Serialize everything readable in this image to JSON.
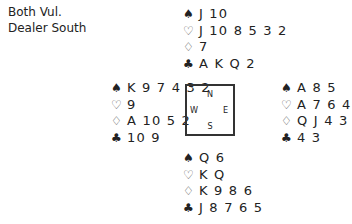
{
  "info": {
    "vulnerability": "Both Vul.",
    "dealer": "Dealer South"
  },
  "suits": {
    "spades": "♠",
    "hearts": "♡",
    "diamonds": "♢",
    "clubs": "♣"
  },
  "compass": {
    "north": "N",
    "south": "S",
    "west": "W",
    "east": "E"
  },
  "hands": {
    "north": {
      "spades": "J 10",
      "hearts": "J 10 8 5 3 2",
      "diamonds": "7",
      "clubs": "A K Q 2"
    },
    "west": {
      "spades": "K 9 7 4 3 2",
      "hearts": "9",
      "diamonds": "A 10 5 2",
      "clubs": "10 9"
    },
    "east": {
      "spades": "A 8 5",
      "hearts": "A 7 6 4",
      "diamonds": "Q J 4 3",
      "clubs": "4 3"
    },
    "south": {
      "spades": "Q 6",
      "hearts": "K Q",
      "diamonds": "K 9 8 6",
      "clubs": "J 8 7 6 5"
    }
  }
}
